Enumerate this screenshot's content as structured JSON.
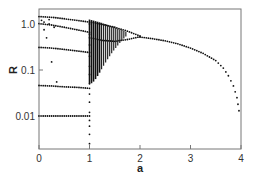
{
  "chart_data": {
    "type": "scatter",
    "title": "",
    "xlabel": "a",
    "ylabel": "R",
    "xlim": [
      0,
      4
    ],
    "ylim": [
      0.0019,
      2.1
    ],
    "yscale": "log",
    "grid": false,
    "legend": null,
    "x_ticks": [
      {
        "value": 0,
        "label": "0"
      },
      {
        "value": 1,
        "label": "1"
      },
      {
        "value": 2,
        "label": "2"
      },
      {
        "value": 3,
        "label": "3"
      },
      {
        "value": 4,
        "label": "4"
      }
    ],
    "y_ticks": [
      {
        "value": 1.0,
        "label": "1.0"
      },
      {
        "value": 0.1,
        "label": "0.1"
      },
      {
        "value": 0.01,
        "label": "0.01"
      }
    ],
    "series": [
      {
        "name": "upper-branch-left",
        "points": [
          [
            0,
            1.45
          ],
          [
            0.25,
            1.4
          ],
          [
            0.5,
            1.3
          ],
          [
            0.75,
            1.2
          ],
          [
            1.0,
            1.1
          ],
          [
            1.25,
            0.98
          ],
          [
            1.5,
            0.85
          ],
          [
            1.75,
            0.7
          ],
          [
            2.0,
            0.55
          ]
        ]
      },
      {
        "name": "second-branch-left",
        "points": [
          [
            0,
            1.02
          ],
          [
            0.25,
            0.95
          ],
          [
            0.5,
            0.85
          ],
          [
            0.75,
            0.75
          ],
          [
            1.0,
            0.66
          ]
        ]
      },
      {
        "name": "lower-fork",
        "points": [
          [
            1.0,
            0.5
          ],
          [
            1.25,
            0.44
          ],
          [
            1.5,
            0.42
          ],
          [
            1.75,
            0.46
          ],
          [
            2.0,
            0.53
          ]
        ]
      },
      {
        "name": "main-curve",
        "points": [
          [
            2.0,
            0.52
          ],
          [
            2.25,
            0.48
          ],
          [
            2.5,
            0.43
          ],
          [
            2.75,
            0.37
          ],
          [
            3.0,
            0.3
          ],
          [
            3.25,
            0.23
          ],
          [
            3.5,
            0.16
          ],
          [
            3.65,
            0.11
          ],
          [
            3.75,
            0.075
          ],
          [
            3.85,
            0.045
          ],
          [
            3.92,
            0.025
          ],
          [
            3.96,
            0.013
          ]
        ]
      },
      {
        "name": "branch-0.3",
        "points": [
          [
            0,
            0.31
          ],
          [
            0.25,
            0.3
          ],
          [
            0.5,
            0.28
          ],
          [
            0.75,
            0.26
          ],
          [
            1.0,
            0.24
          ]
        ]
      },
      {
        "name": "branch-0.05",
        "points": [
          [
            0,
            0.046
          ],
          [
            0.25,
            0.045
          ],
          [
            0.5,
            0.043
          ],
          [
            0.75,
            0.042
          ],
          [
            1.0,
            0.04
          ]
        ]
      },
      {
        "name": "branch-0.01",
        "points": [
          [
            0,
            0.01
          ],
          [
            0.25,
            0.01
          ],
          [
            0.5,
            0.01
          ],
          [
            0.75,
            0.01
          ],
          [
            1.0,
            0.01
          ]
        ]
      },
      {
        "name": "scatter-near-zero",
        "points": [
          [
            0.05,
            1.2
          ],
          [
            0.1,
            0.75
          ],
          [
            0.15,
            0.5
          ],
          [
            0.2,
            1.25
          ],
          [
            0.25,
            0.15
          ],
          [
            0.3,
            0.85
          ],
          [
            0.35,
            0.055
          ],
          [
            0.1,
            1.1
          ],
          [
            0.2,
            1.0
          ]
        ]
      },
      {
        "name": "vertical-at-a1",
        "points": [
          [
            1.0,
            0.0025
          ],
          [
            1.0,
            0.004
          ],
          [
            1.0,
            0.006
          ],
          [
            1.0,
            0.008
          ],
          [
            1.0,
            0.012
          ],
          [
            1.0,
            0.02
          ],
          [
            1.0,
            0.03
          ],
          [
            1.0,
            0.05
          ],
          [
            1.0,
            0.08
          ],
          [
            1.0,
            0.12
          ],
          [
            1.0,
            0.2
          ],
          [
            1.0,
            0.35
          ],
          [
            1.0,
            0.6
          ],
          [
            1.0,
            1.0
          ]
        ]
      }
    ],
    "dense_band": {
      "a_start": 1.0,
      "a_end": 1.75,
      "description": "dense vertical striping between a=1 and ~1.75, R from ~0.05 to ~1.2 narrowing to fork"
    }
  }
}
